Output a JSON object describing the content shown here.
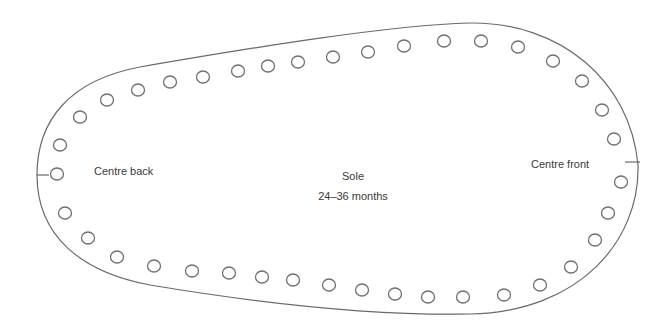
{
  "diagram": {
    "type": "sewing-pattern",
    "piece_name": "Sole",
    "size": "24–36 months",
    "labels": {
      "centre_back": "Centre back",
      "centre_front": "Centre front",
      "title": "Sole",
      "size": "24–36 months"
    },
    "colors": {
      "outline": "#6a6a6a",
      "holes": "#707070",
      "text": "#3a3a3a",
      "background": "#ffffff"
    },
    "hole_count": 40,
    "holes": [
      [
        57,
        174
      ],
      [
        60,
        145
      ],
      [
        80,
        117
      ],
      [
        107,
        100
      ],
      [
        138,
        90
      ],
      [
        170,
        82
      ],
      [
        203,
        77
      ],
      [
        238,
        71
      ],
      [
        268,
        66
      ],
      [
        298,
        62
      ],
      [
        333,
        57
      ],
      [
        368,
        52
      ],
      [
        404,
        46
      ],
      [
        444,
        41
      ],
      [
        481,
        41
      ],
      [
        518,
        47
      ],
      [
        553,
        61
      ],
      [
        582,
        81
      ],
      [
        602,
        110
      ],
      [
        614,
        139
      ],
      [
        621,
        182
      ],
      [
        608,
        213
      ],
      [
        595,
        240
      ],
      [
        571,
        267
      ],
      [
        540,
        285
      ],
      [
        504,
        295
      ],
      [
        463,
        297
      ],
      [
        428,
        297
      ],
      [
        395,
        294
      ],
      [
        362,
        290
      ],
      [
        329,
        285
      ],
      [
        293,
        280
      ],
      [
        262,
        277
      ],
      [
        229,
        273
      ],
      [
        192,
        271
      ],
      [
        154,
        266
      ],
      [
        117,
        257
      ],
      [
        88,
        238
      ],
      [
        65,
        213
      ]
    ],
    "hole_radius": 6.5
  }
}
